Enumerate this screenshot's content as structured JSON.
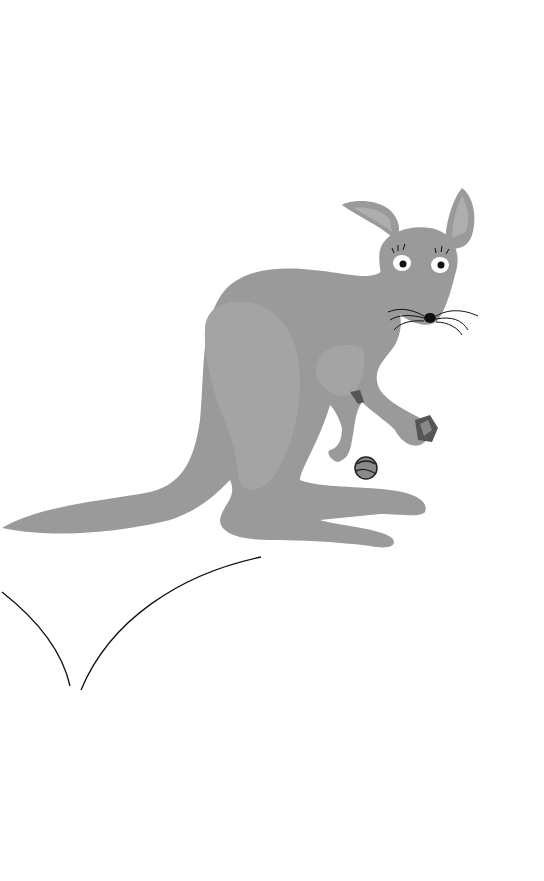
{
  "scene": {
    "subject": "kangaroo illustration",
    "background": "#ffffff",
    "colors": {
      "body": "#9a9a9a",
      "highlight": "#a4a4a4",
      "inner_ear": "#aeaeae",
      "eye_white": "#ffffff",
      "pupil": "#111111",
      "line": "#111111"
    },
    "elements": [
      "kangaroo",
      "ball",
      "held-object",
      "ground-curves"
    ]
  }
}
